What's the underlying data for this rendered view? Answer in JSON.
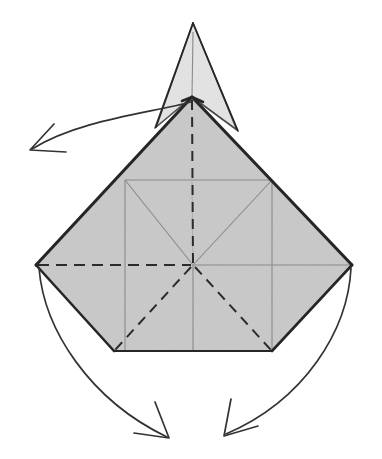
{
  "figure": {
    "kind": "origami-fold-diagram",
    "canvas": {
      "width": 382,
      "height": 459
    },
    "background_color": "#ffffff"
  },
  "palette": {
    "paper_front_fill": "#c9c9c9",
    "paper_back_fill": "#e3e3e3",
    "outline_color": "#262626",
    "crease_existing_color": "#8a8a8a",
    "fold_mountain_color": "#2b2b2b",
    "arrow_color": "#333333"
  },
  "geometry": {
    "center_point": {
      "x": 193,
      "y": 265,
      "label": "center"
    },
    "diamond": {
      "top": {
        "x": 192,
        "y": 97
      },
      "left": {
        "x": 36,
        "y": 265
      },
      "right": {
        "x": 352,
        "y": 265
      },
      "bottom_left": {
        "x": 114,
        "y": 351
      },
      "bottom_right": {
        "x": 272,
        "y": 351
      }
    },
    "spike": {
      "apex": {
        "x": 193,
        "y": 23
      },
      "left_base": {
        "x": 155,
        "y": 128
      },
      "right_base": {
        "x": 237,
        "y": 130
      }
    },
    "inner_square": {
      "left_x": 125,
      "right_x": 272,
      "top_y": 180,
      "bottom_y": 351
    }
  },
  "creases": [
    {
      "name": "vertical-center-mountain",
      "style": "dashed",
      "color": "#2b2b2b",
      "from": "diamond.top",
      "to": "center"
    },
    {
      "name": "horizontal-left-mountain",
      "style": "dashed",
      "color": "#2b2b2b",
      "from": "diamond.left",
      "to": "center"
    },
    {
      "name": "horizontal-right-existing",
      "style": "solid",
      "color": "#8a8a8a",
      "from": "center",
      "to": "diamond.right"
    },
    {
      "name": "diagonal-lower-left-mountain",
      "style": "dashed",
      "color": "#2b2b2b",
      "from": "center",
      "to": "diamond.bottom_left"
    },
    {
      "name": "diagonal-lower-right-mountain",
      "style": "dashed",
      "color": "#2b2b2b",
      "from": "center",
      "to": "diamond.bottom_right"
    },
    {
      "name": "diagonal-upper-left-existing",
      "style": "solid",
      "color": "#8a8a8a",
      "from": "center",
      "to": "inner_square.top_left"
    },
    {
      "name": "diagonal-upper-right-existing",
      "style": "solid",
      "color": "#8a8a8a",
      "from": "center",
      "to": "inner_square.top_right"
    },
    {
      "name": "inner-square-top-existing",
      "style": "solid",
      "color": "#8a8a8a"
    },
    {
      "name": "inner-square-left-existing",
      "style": "solid",
      "color": "#8a8a8a"
    },
    {
      "name": "inner-square-right-existing",
      "style": "solid",
      "color": "#8a8a8a"
    },
    {
      "name": "spike-center-existing",
      "style": "solid",
      "color": "#8a8a8a"
    },
    {
      "name": "vertical-lower-center-existing",
      "style": "solid",
      "color": "#8a8a8a"
    }
  ],
  "arrows": [
    {
      "name": "fold-arrow-top-left",
      "direction": "down-left",
      "start": {
        "x": 191,
        "y": 102
      },
      "end": {
        "x": 31,
        "y": 150
      },
      "head": "open-v",
      "description": "top flap folds over to the left"
    },
    {
      "name": "fold-arrow-bottom-left",
      "direction": "down-right",
      "start": {
        "x": 39,
        "y": 268
      },
      "end": {
        "x": 168,
        "y": 437
      },
      "head": "open-v",
      "description": "left flap swings down and to the right"
    },
    {
      "name": "fold-arrow-bottom-right",
      "direction": "down-left",
      "start": {
        "x": 351,
        "y": 268
      },
      "end": {
        "x": 224,
        "y": 434
      },
      "head": "open-v",
      "description": "right flap swings down and to the left"
    }
  ]
}
